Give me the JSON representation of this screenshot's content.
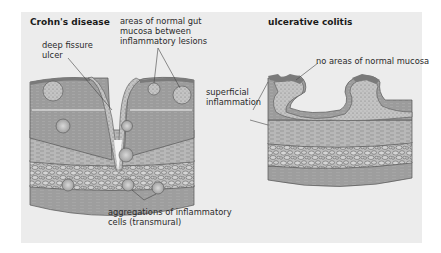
{
  "figure": {
    "panels": [
      {
        "id": "crohns",
        "title": "Crohn's disease",
        "labels": {
          "fissure": "deep fissure\nulcer",
          "normal_mucosa": "areas of normal gut\nmucosa between\ninflammatory lesions",
          "aggregations": "aggregations of inflammatory\ncells (transmural)"
        }
      },
      {
        "id": "uc",
        "title": "ulcerative colitis",
        "labels": {
          "no_normal": "no areas of normal mucosa",
          "superficial": "superficial\ninflammation"
        }
      }
    ],
    "colors": {
      "background": "#ececec",
      "mucosa": "#9a9a9a",
      "muscle": "#b5b5b5",
      "submucosa": "#c8c8c8",
      "inflamed": "#bdbdbd",
      "outline": "#555555"
    }
  }
}
